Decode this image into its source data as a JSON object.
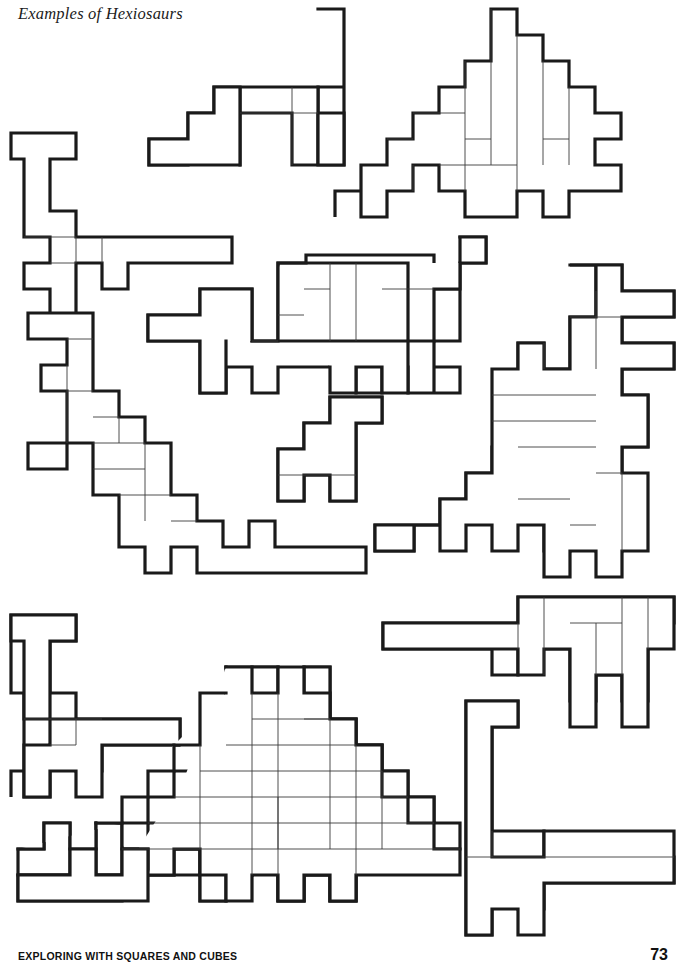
{
  "page": {
    "title": "Examples of Hexiosaurs",
    "footer_title": "EXPLORING WITH SQUARES AND CUBES",
    "page_number": "73",
    "background_color": "#ffffff",
    "ink_color": "#1a1a1a",
    "seam_color": "#3a3a3a"
  },
  "grid": {
    "cell_size": 26,
    "origin_x": 11,
    "origin_y": 9,
    "unit_label": "square",
    "piece_size_squares": 6
  },
  "figures": [
    {
      "name": "hexiosaur-top-left",
      "position": "top-left",
      "pieces_count": 3,
      "origin_cells": [
        0,
        4.75
      ],
      "outline": "M0,0 H4 V1 H1 V3 H2.6 V4 H1 V5 H0 V4 H-0.4 V3 H0 V1 H-1 V0 Z",
      "cells": [
        [
          0,
          0
        ],
        [
          1,
          0
        ],
        [
          2,
          0
        ],
        [
          3,
          0
        ],
        [
          0,
          1
        ],
        [
          0,
          2
        ],
        [
          1,
          2
        ],
        [
          2,
          2
        ],
        [
          3,
          2
        ],
        [
          4,
          2
        ],
        [
          5,
          2
        ],
        [
          6,
          2
        ],
        [
          7,
          2
        ],
        [
          0,
          3
        ],
        [
          1,
          3
        ],
        [
          2,
          3
        ],
        [
          3,
          3
        ],
        [
          0,
          4
        ],
        [
          2,
          4
        ],
        [
          3,
          4
        ]
      ],
      "paths_outline": [
        "M11,139 L76,139 L76,165 L50,165 L50,243 L76,243 L76,217 L102,217 L102,243 L232,243 L232,269 L128,269 L128,295 L102,295 L102,269 L76,269 L76,295 L50,295 L50,269 L24,269 L24,165 L11,165 Z"
      ]
    },
    {
      "name": "hexiosaur-top-center",
      "position": "top-center",
      "pieces_count": 4,
      "description": "stepped-tail long-neck"
    },
    {
      "name": "hexiosaur-top-right",
      "position": "top-right",
      "pieces_count": 7,
      "description": "large stepped-back dinosaur with crest"
    },
    {
      "name": "hexiosaur-middle-left",
      "position": "middle-left",
      "pieces_count": 6,
      "description": "upright dinosaur with long tail"
    },
    {
      "name": "hexiosaur-middle-center",
      "position": "middle-center",
      "pieces_count": 6,
      "description": "long-bodied walking dinosaur"
    },
    {
      "name": "hexiosaur-middle-center-small",
      "position": "middle-center-lower",
      "pieces_count": 2,
      "description": "small seated dinosaur"
    },
    {
      "name": "hexiosaur-middle-right",
      "position": "middle-right",
      "pieces_count": 7,
      "description": "rearing dinosaur with raised head"
    },
    {
      "name": "hexiosaur-bottom-left",
      "position": "bottom-left",
      "pieces_count": 3,
      "description": "small four-legged long-neck"
    },
    {
      "name": "hexiosaur-bottom-center",
      "position": "bottom-center",
      "pieces_count": 12,
      "description": "large horned dinosaur with stepped back and tail"
    },
    {
      "name": "hexiosaur-bottom-right",
      "position": "bottom-right",
      "pieces_count": 6,
      "description": "tall long-neck with horizontal tail"
    }
  ],
  "shapes": {
    "outlines": [
      "M11,139 L76,139 L76,165 L50,165 L50,243 L76,243 L76,217 L102,217 L102,243 L232,243 L232,269 L128,269 L128,295 L102,295 L102,269 L76,269 L76,295 L50,295 L50,269 L24,269 L24,165 L11,165 Z",
      "M318,9 L344,9 L344,113 L306,113 L306,139 L241,139 L241,113 L228,113 L228,139 L202,139 L202,113 L150,113 L150,165 L253,165 L253,139 L305,139 L305,165 L344,165 L344,113",
      "M318,9 L344,9 L344,87 L318,87 L318,165 L292,165 L292,113 L241,113 L241,87 L228,87 L228,113 L202,113 L202,139 L150,139 L150,165 L253,165 L253,139 L292,139",
      "M498,9 L524,9 L524,35 L550,35 L550,61 L576,61 L576,87 L602,87 L602,113 L576,113 L576,139 L602,139 L602,191 L550,191 L550,217 L576,217 L576,165 L628,165 L628,139 L654,139 L654,113 L602,113",
      "M28,313 L93,313 L93,339 L119,339 L119,391 L145,391 L145,417 L119,417 L119,469 L145,469 L145,495 L119,495 L119,547 L93,547 L93,573 L28,573 L28,547 L67,547 L67,521 L41,521 L41,469 L15,469 L15,443 L67,443 L67,339 L28,339 Z"
    ]
  }
}
